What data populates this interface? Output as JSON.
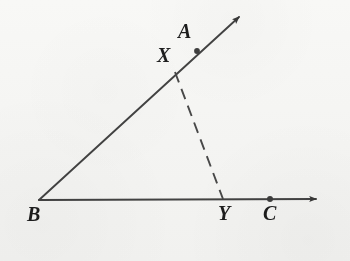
{
  "figure": {
    "background_color": "#fbfbfa",
    "ink_color": "#3a3a3a",
    "label_color": "#1d1d1d",
    "vertex_label": "B",
    "labels": [
      {
        "id": "label-A",
        "text": "A",
        "x": 178,
        "y": 21,
        "size": 20
      },
      {
        "id": "label-X",
        "text": "X",
        "x": 157,
        "y": 45,
        "size": 20
      },
      {
        "id": "label-B",
        "text": "B",
        "x": 27,
        "y": 204,
        "size": 20
      },
      {
        "id": "label-Y",
        "text": "Y",
        "x": 218,
        "y": 203,
        "size": 20
      },
      {
        "id": "label-C",
        "text": "C",
        "x": 263,
        "y": 203,
        "size": 20
      }
    ],
    "points": [
      {
        "id": "point-B",
        "label": "B",
        "x": 39,
        "y": 200,
        "dot": false
      },
      {
        "id": "point-X",
        "label": "X",
        "x": 175,
        "y": 72,
        "dot": false
      },
      {
        "id": "point-A",
        "label": "A",
        "x": 197,
        "y": 51,
        "dot": true
      },
      {
        "id": "point-Y",
        "label": "Y",
        "x": 223,
        "y": 199,
        "dot": false
      },
      {
        "id": "point-C",
        "label": "C",
        "x": 270,
        "y": 199,
        "dot": true
      }
    ],
    "rays": [
      {
        "id": "ray-BA",
        "name": "ray-ba",
        "from": "B",
        "through": "A",
        "start": {
          "x": 39,
          "y": 200
        },
        "end": {
          "x": 243,
          "y": 13
        },
        "arrow_at_end": true
      },
      {
        "id": "ray-BC",
        "name": "ray-bc",
        "from": "B",
        "through": "C",
        "start": {
          "x": 39,
          "y": 200
        },
        "end": {
          "x": 324,
          "y": 199
        },
        "arrow_at_end": true
      }
    ],
    "segments": [
      {
        "id": "segment-XY",
        "name": "segment-xy",
        "from": "X",
        "to": "Y",
        "start": {
          "x": 175,
          "y": 72
        },
        "end": {
          "x": 223,
          "y": 199
        },
        "style": "dashed",
        "dash_length": 11,
        "dash_gap": 7
      }
    ]
  }
}
